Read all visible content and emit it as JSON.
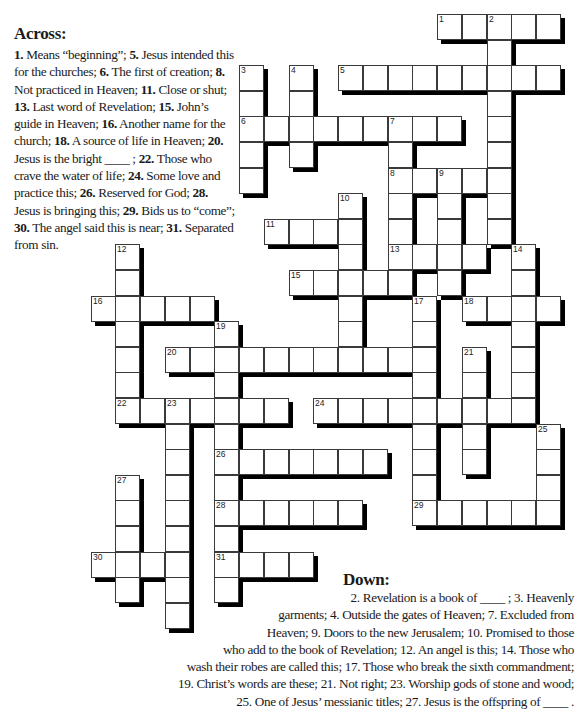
{
  "puzzle": {
    "across_heading": "Across:",
    "down_heading": "Down:",
    "grid": {
      "origin_x": 90.5,
      "origin_y": 14,
      "pitch_x": 24.75,
      "pitch_y": 25.6,
      "cell_w": 25,
      "cell_h": 26,
      "shadow_px": 4
    },
    "across_clues": [
      {
        "number": "1.",
        "text": "Means “beginning”;"
      },
      {
        "number": "5.",
        "text": "Jesus intended this for the churches;"
      },
      {
        "number": "6.",
        "text": "The first of creation;"
      },
      {
        "number": "8.",
        "text": "Not practiced in Heaven;"
      },
      {
        "number": "11.",
        "text": "Close or shut;"
      },
      {
        "number": "13.",
        "text": "Last word of Revelation;"
      },
      {
        "number": "15.",
        "text": "John’s guide in Heaven;"
      },
      {
        "number": "16.",
        "text": "Another name for the church;"
      },
      {
        "number": "18.",
        "text": "A source of life in Heaven;"
      },
      {
        "number": "20.",
        "text": "Jesus is the bright ____ ;"
      },
      {
        "number": "22.",
        "text": "Those who crave the water of life;"
      },
      {
        "number": "24.",
        "text": "Some love and practice this;"
      },
      {
        "number": "26.",
        "text": "Reserved for God;"
      },
      {
        "number": "28.",
        "text": "Jesus is bringing this;"
      },
      {
        "number": "29.",
        "text": "Bids us to “come”;"
      },
      {
        "number": "30.",
        "text": "The angel said this is near;"
      },
      {
        "number": "31.",
        "text": "Separated from sin."
      }
    ],
    "down_lines": [
      "2. Revelation is a book of ____ ;  3. Heavenly",
      "garments;  4. Outside the gates of Heaven; 7. Excluded from",
      "Heaven;  9. Doors to the new Jerusalem;  10. Promised to those",
      "who add to the book of Revelation;  12. An angel is this;  14. Those who",
      "wash their robes are called this;  17. Those who break the sixth commandment;",
      "19. Christ’s words are these;  21. Not right;  23. Worship gods of stone and wood;",
      "25. One of Jesus’ messianic titles;  27. Jesus is the offspring of ____ ."
    ],
    "down_clues": [
      {
        "number": "2.",
        "text": "Revelation is a book of ____ ;"
      },
      {
        "number": "3.",
        "text": "Heavenly garments;"
      },
      {
        "number": "4.",
        "text": "Outside the gates of Heaven;"
      },
      {
        "number": "7.",
        "text": "Excluded from Heaven;"
      },
      {
        "number": "9.",
        "text": "Doors to the new Jerusalem;"
      },
      {
        "number": "10.",
        "text": "Promised to those who add to the book of Revelation;"
      },
      {
        "number": "12.",
        "text": "An angel is this;"
      },
      {
        "number": "14.",
        "text": "Those who wash their robes are called this;"
      },
      {
        "number": "17.",
        "text": "Those who break the sixth commandment;"
      },
      {
        "number": "19.",
        "text": "Christ’s words are these;"
      },
      {
        "number": "21.",
        "text": "Not right;"
      },
      {
        "number": "23.",
        "text": "Worship gods of stone and wood;"
      },
      {
        "number": "25.",
        "text": "One of Jesus’ messianic titles;"
      },
      {
        "number": "27.",
        "text": "Jesus is the offspring of ____ ."
      }
    ],
    "words": [
      {
        "number": 1,
        "dir": "across",
        "row": 0,
        "col": 14,
        "length": 5
      },
      {
        "number": 2,
        "dir": "down",
        "row": 0,
        "col": 16,
        "length": 9
      },
      {
        "number": 3,
        "dir": "down",
        "row": 2,
        "col": 6,
        "length": 5
      },
      {
        "number": 4,
        "dir": "down",
        "row": 2,
        "col": 8,
        "length": 4
      },
      {
        "number": 5,
        "dir": "across",
        "row": 2,
        "col": 10,
        "length": 9
      },
      {
        "number": 6,
        "dir": "across",
        "row": 4,
        "col": 6,
        "length": 9
      },
      {
        "number": 7,
        "dir": "down",
        "row": 4,
        "col": 12,
        "length": 7
      },
      {
        "number": 8,
        "dir": "across",
        "row": 6,
        "col": 12,
        "length": 5
      },
      {
        "number": 9,
        "dir": "down",
        "row": 6,
        "col": 14,
        "length": 5
      },
      {
        "number": 10,
        "dir": "down",
        "row": 7,
        "col": 10,
        "length": 7
      },
      {
        "number": 11,
        "dir": "across",
        "row": 8,
        "col": 7,
        "length": 4
      },
      {
        "number": 12,
        "dir": "down",
        "row": 9,
        "col": 1,
        "length": 7
      },
      {
        "number": 13,
        "dir": "across",
        "row": 9,
        "col": 12,
        "length": 4
      },
      {
        "number": 14,
        "dir": "down",
        "row": 9,
        "col": 17,
        "length": 7
      },
      {
        "number": 15,
        "dir": "across",
        "row": 10,
        "col": 8,
        "length": 5
      },
      {
        "number": 16,
        "dir": "across",
        "row": 11,
        "col": 0,
        "length": 5
      },
      {
        "number": 17,
        "dir": "down",
        "row": 11,
        "col": 13,
        "length": 9
      },
      {
        "number": 18,
        "dir": "across",
        "row": 11,
        "col": 15,
        "length": 4
      },
      {
        "number": 19,
        "dir": "down",
        "row": 12,
        "col": 5,
        "length": 11
      },
      {
        "number": 20,
        "dir": "across",
        "row": 13,
        "col": 3,
        "length": 11
      },
      {
        "number": 21,
        "dir": "down",
        "row": 13,
        "col": 15,
        "length": 5
      },
      {
        "number": 22,
        "dir": "across",
        "row": 15,
        "col": 1,
        "length": 7
      },
      {
        "number": 23,
        "dir": "down",
        "row": 15,
        "col": 3,
        "length": 9
      },
      {
        "number": 24,
        "dir": "across",
        "row": 15,
        "col": 9,
        "length": 9
      },
      {
        "number": 25,
        "dir": "down",
        "row": 16,
        "col": 18,
        "length": 4
      },
      {
        "number": 26,
        "dir": "across",
        "row": 17,
        "col": 5,
        "length": 7
      },
      {
        "number": 27,
        "dir": "down",
        "row": 18,
        "col": 1,
        "length": 5
      },
      {
        "number": 28,
        "dir": "across",
        "row": 19,
        "col": 5,
        "length": 6
      },
      {
        "number": 29,
        "dir": "across",
        "row": 19,
        "col": 13,
        "length": 6
      },
      {
        "number": 30,
        "dir": "across",
        "row": 21,
        "col": 0,
        "length": 4
      },
      {
        "number": 31,
        "dir": "across",
        "row": 21,
        "col": 5,
        "length": 4
      }
    ]
  }
}
